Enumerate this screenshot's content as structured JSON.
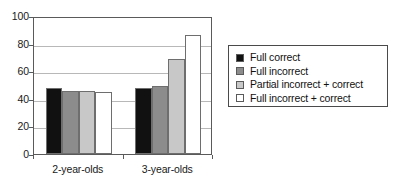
{
  "chart_data": {
    "type": "bar",
    "title": "",
    "xlabel": "",
    "ylabel": "",
    "ylim": [
      0,
      100
    ],
    "yticks": [
      0,
      20,
      40,
      60,
      80,
      100
    ],
    "ytick_labels": [
      "0",
      "20",
      "40",
      "60",
      "80",
      "100"
    ],
    "grid": true,
    "legend_position": "right",
    "categories": [
      "2-year-olds",
      "3-year-olds"
    ],
    "series": [
      {
        "name": "Full correct",
        "color": "#111111",
        "values": [
          48,
          48
        ]
      },
      {
        "name": "Full incorrect",
        "color": "#8c8c8c",
        "values": [
          46,
          49
        ]
      },
      {
        "name": "Partial incorrect + correct",
        "color": "#c8c8c8",
        "values": [
          46,
          69
        ]
      },
      {
        "name": "Full incorrect + correct",
        "color": "#ffffff",
        "values": [
          45,
          86
        ]
      }
    ]
  },
  "legend": {
    "items": [
      {
        "label": "Full correct",
        "color": "#111111"
      },
      {
        "label": "Full incorrect",
        "color": "#8c8c8c"
      },
      {
        "label": "Partial incorrect + correct",
        "color": "#c8c8c8"
      },
      {
        "label": "Full incorrect + correct",
        "color": "#ffffff"
      }
    ]
  }
}
